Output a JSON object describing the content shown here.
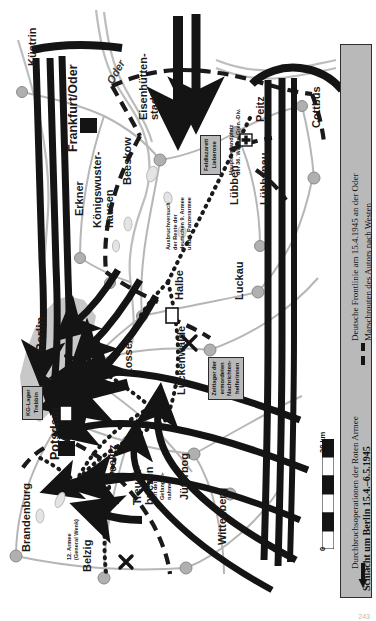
{
  "map": {
    "title": "Schlacht um Berlin 15.4.-6.5.1945",
    "colors": {
      "arrow_black": "#141414",
      "city_fill": "#c8c8c8",
      "road": "#b6b6b6",
      "legend_bg": "#b9b9b9",
      "frontline": "#1a1a1a"
    },
    "scale": {
      "min": "0",
      "max": "30 km"
    },
    "page_number": "243"
  },
  "legend": {
    "title": "Schlacht um Berlin 15.4.–6.5.1945",
    "items": [
      {
        "symbol": "arrow",
        "label": "Durchbruchsoperationen der Roten Armee"
      },
      {
        "symbol": "dashed",
        "label": "Deutsche Frontlinie am 15.4.1945 an der Oder"
      },
      {
        "symbol": "dotted",
        "label": "Marschrouten des Autors nach Westen"
      }
    ]
  },
  "cities": [
    {
      "name": "Küstrin",
      "x": 26,
      "y": 66,
      "rot": true,
      "style": "city"
    },
    {
      "name": "Frankfurt/Oder",
      "x": 66,
      "y": 152,
      "rot": true,
      "style": "city-big"
    },
    {
      "name": "Eisenhütten-",
      "x": 137,
      "y": 120,
      "rot": true,
      "style": "city"
    },
    {
      "name": "stadt",
      "x": 148,
      "y": 120,
      "rot": true,
      "style": "city"
    },
    {
      "name": "Peitz",
      "x": 254,
      "y": 122,
      "rot": true,
      "style": "city"
    },
    {
      "name": "Cottbus",
      "x": 310,
      "y": 128,
      "rot": true,
      "style": "city"
    },
    {
      "name": "Beeskow",
      "x": 121,
      "y": 185,
      "rot": true,
      "style": "city"
    },
    {
      "name": "Erkner",
      "x": 73,
      "y": 216,
      "rot": true,
      "style": "city"
    },
    {
      "name": "Königswuster-",
      "x": 91,
      "y": 228,
      "rot": true,
      "style": "city"
    },
    {
      "name": "hausen",
      "x": 103,
      "y": 228,
      "rot": true,
      "style": "city"
    },
    {
      "name": "Lübben",
      "x": 228,
      "y": 205,
      "rot": true,
      "style": "city"
    },
    {
      "name": "Lübbenau",
      "x": 258,
      "y": 205,
      "rot": true,
      "style": "city"
    },
    {
      "name": "Halbe",
      "x": 173,
      "y": 300,
      "rot": true,
      "style": "city"
    },
    {
      "name": "Luckau",
      "x": 233,
      "y": 300,
      "rot": true,
      "style": "city"
    },
    {
      "name": "Zossen",
      "x": 122,
      "y": 375,
      "rot": true,
      "style": "city"
    },
    {
      "name": "Lückenwalde",
      "x": 175,
      "y": 395,
      "rot": true,
      "style": "city"
    },
    {
      "name": "Berlin",
      "x": 34,
      "y": 352,
      "rot": true,
      "style": "city-big"
    },
    {
      "name": "Potsdam",
      "x": 48,
      "y": 460,
      "rot": true,
      "style": "city-big"
    },
    {
      "name": "Brandenburg",
      "x": 20,
      "y": 552,
      "rot": true,
      "style": "city"
    },
    {
      "name": "Beelitz",
      "x": 106,
      "y": 480,
      "rot": true,
      "style": "city"
    },
    {
      "name": "Belzig",
      "x": 81,
      "y": 572,
      "rot": true,
      "style": "city"
    },
    {
      "name": "Treuen-",
      "x": 131,
      "y": 505,
      "rot": true,
      "style": "city"
    },
    {
      "name": "briezen",
      "x": 143,
      "y": 505,
      "rot": true,
      "style": "city"
    },
    {
      "name": "Jüterbog",
      "x": 178,
      "y": 500,
      "rot": true,
      "style": "city"
    },
    {
      "name": "Wittenberg",
      "x": 216,
      "y": 545,
      "rot": true,
      "style": "city"
    }
  ],
  "rivers": [
    {
      "name": "Oder",
      "x": 104,
      "y": 80,
      "rot": -60
    }
  ],
  "annotations": [
    {
      "name": "12. Armee (General Wenk)",
      "text": "12. Armee\n(General Wenk)",
      "x": 66,
      "y": 560
    },
    {
      "name": "Ausbruchversuch",
      "text": "Ausbruchversuch\nder Reste der\ndeutschen 9. Armee\nund 4. Panzerarmee",
      "x": 165,
      "y": 250
    },
    {
      "name": "Hauptverbandplatz",
      "text": "Hauptverbandplatz\nder 36. Waffen-Gren.-Div.",
      "x": 228,
      "y": 175
    },
    {
      "name": "Ort der Gefangennahme",
      "text": "Ort der\nGefangen-\nnahme",
      "x": 152,
      "y": 500
    }
  ],
  "box_notes": [
    {
      "name": "Feldlazarett Lieberose",
      "text": "Feldlazarett\nLieberose",
      "x": 200,
      "y": 175
    },
    {
      "name": "KG-Lager Trebbin",
      "text": "KG-Lager\nTrebbin",
      "x": 22,
      "y": 420
    },
    {
      "name": "Zeltlager",
      "text": "Zeltlager der\nermordeten\nNachrichten-\nhelferinnen",
      "x": 208,
      "y": 400
    }
  ]
}
